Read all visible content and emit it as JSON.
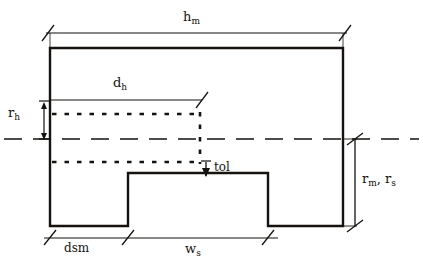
{
  "diagram": {
    "stroke_color": "#15120f",
    "background_color": "#ffffff",
    "labels": {
      "h_m": {
        "base": "h",
        "sub": "m"
      },
      "d_h": {
        "base": "d",
        "sub": "h"
      },
      "r_h": {
        "base": "r",
        "sub": "h"
      },
      "tol": {
        "base": "tol",
        "sub": ""
      },
      "r_m_r_s": {
        "base1": "r",
        "sub1": "m",
        "sep": ", ",
        "base2": "r",
        "sub2": "s"
      },
      "dsm": {
        "base": "dsm",
        "sub": ""
      },
      "w_s": {
        "base": "w",
        "sub": "s"
      }
    },
    "geometry": {
      "outer_rect": {
        "x1": 50,
        "y1": 48,
        "x2": 343,
        "y2": 226
      },
      "notch": {
        "x1": 128,
        "y1": 173,
        "x2": 268,
        "y2": 226
      },
      "centerline_y": 139,
      "dotted_upper_y": 114,
      "dotted_lower_y": 162,
      "dotted_x_start": 52,
      "dotted_x_end": 200,
      "dh_line_y": 100,
      "dh_x1": 50,
      "dh_x2": 200,
      "hm_line_y": 33,
      "hm_x1": 46,
      "hm_x2": 347,
      "rh_dim_x": 44,
      "rh_y1": 102,
      "rh_y2": 139,
      "right_dim_x": 355,
      "right_y1": 139,
      "right_y2": 226,
      "bottom_line_y": 238,
      "bottom_ticks": [
        50,
        128,
        268
      ],
      "bottom_x1": 44,
      "bottom_x2": 276
    }
  }
}
